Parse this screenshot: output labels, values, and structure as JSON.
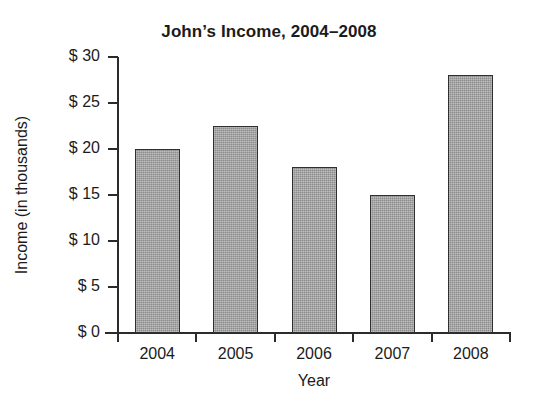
{
  "chart_data": {
    "type": "bar",
    "title": "John’s Income, 2004–2008",
    "xlabel": "Year",
    "ylabel": "Income (in thousands)",
    "categories": [
      "2004",
      "2005",
      "2006",
      "2007",
      "2008"
    ],
    "values": [
      20,
      22.5,
      18,
      15,
      28
    ],
    "ylim": [
      0,
      30
    ],
    "ytick_values": [
      30,
      25,
      20,
      15,
      10,
      5,
      0
    ],
    "ytick_labels": [
      "$ 30",
      "$ 25",
      "$ 20",
      "$ 15",
      "$ 10",
      "$ 5",
      "$ 0"
    ],
    "grid": false,
    "legend": false,
    "bar_color": "#9d9d9d",
    "bar_edge_color": "#2f2f2f",
    "axis_color": "#2b2b2b",
    "background_color": "#ffffff"
  },
  "labels": {
    "y_tick_0": "$ 30",
    "y_tick_1": "$ 25",
    "y_tick_2": "$ 20",
    "y_tick_3": "$ 15",
    "y_tick_4": "$ 10",
    "y_tick_5": "$ 5",
    "y_tick_6": "$ 0",
    "x_tick_0": "2004",
    "x_tick_1": "2005",
    "x_tick_2": "2006",
    "x_tick_3": "2007",
    "x_tick_4": "2008"
  }
}
